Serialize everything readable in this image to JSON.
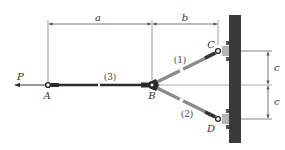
{
  "figure": {
    "type": "truss-statics-diagram",
    "colors": {
      "rod": "#2b2b2b",
      "link": "#8a8a8a",
      "wall": "#3a3a3a",
      "dim_line": "#555555",
      "label": "#333333"
    },
    "force": {
      "label": "P",
      "direction": "left"
    },
    "points": {
      "A": {
        "label": "A"
      },
      "B": {
        "label": "B"
      },
      "C": {
        "label": "C"
      },
      "D": {
        "label": "D"
      }
    },
    "members": [
      {
        "id": "1",
        "label": "(1)",
        "from": "B",
        "to": "C"
      },
      {
        "id": "2",
        "label": "(2)",
        "from": "B",
        "to": "D"
      },
      {
        "id": "3",
        "label": "(3)",
        "from": "A",
        "to": "B"
      }
    ],
    "dimensions": {
      "a": {
        "label": "a"
      },
      "b": {
        "label": "b"
      },
      "c_upper": {
        "label": "c"
      },
      "c_lower": {
        "label": "c"
      }
    }
  }
}
